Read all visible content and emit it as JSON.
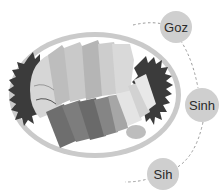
{
  "illustration": {
    "subject": "sashimi-plate",
    "colors": {
      "plate_rim": "#c9c9c9",
      "plate_inner": "#ffffff",
      "garnish": "#3b3b3b",
      "slice_light": "#d4d4d4",
      "slice_mid": "#a9a9a9",
      "slice_dark": "#6e6e6e",
      "connector": "#9a9a9a",
      "circle_fill": "#cfcfcf",
      "label_text": "#2a2a2a"
    }
  },
  "labels": [
    {
      "text": "Goz",
      "cx": 176,
      "cy": 27,
      "r": 16
    },
    {
      "text": "Sinh",
      "cx": 202,
      "cy": 105,
      "r": 17
    },
    {
      "text": "Sih",
      "cx": 163,
      "cy": 174,
      "r": 16
    }
  ]
}
